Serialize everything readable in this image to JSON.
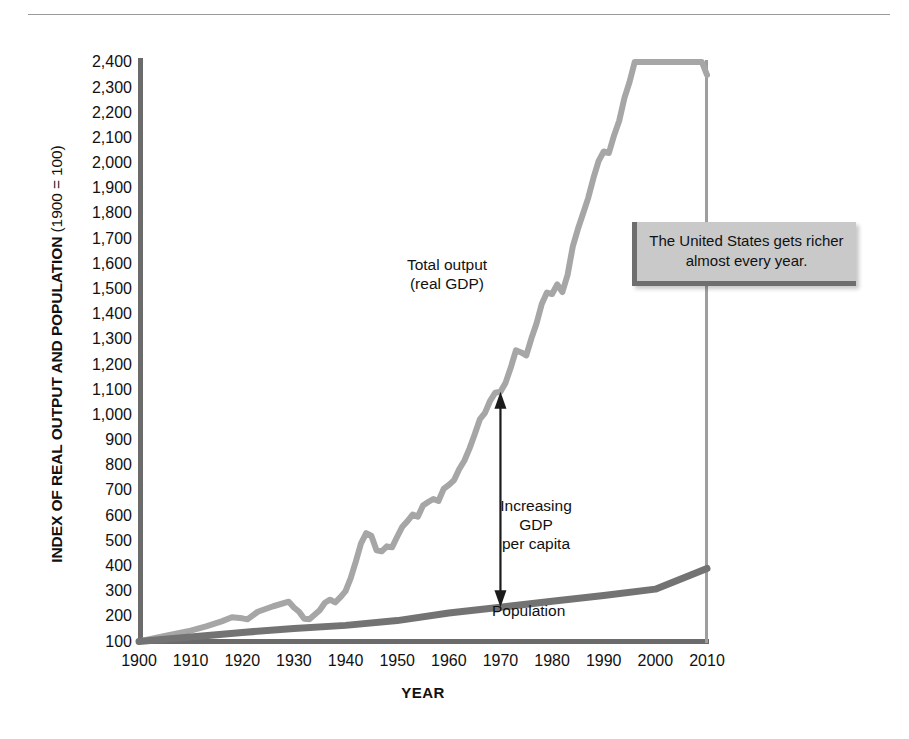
{
  "figure": {
    "y_axis_title_bold": "INDEX OF REAL OUTPUT AND POPULATION",
    "y_axis_title_light": " (1900 = 100)",
    "x_axis_title": "YEAR",
    "callout_text": "The United States gets richer almost every year.",
    "label_total_output": "Total output\n(real GDP)",
    "label_increasing_gdp": "Increasing\nGDP\nper capita",
    "label_population": "Population"
  },
  "colors": {
    "gdp_line": "#a6a6a6",
    "population_line": "#737373",
    "axis": "#6b6b6b",
    "callout_bg": "#c9c9c9",
    "callout_border": "#6e6e6e",
    "text": "#111111"
  },
  "chart_data": {
    "type": "line",
    "title": "",
    "xlabel": "YEAR",
    "ylabel": "INDEX OF REAL OUTPUT AND POPULATION (1900 = 100)",
    "xlim": [
      1900,
      2010
    ],
    "ylim": [
      100,
      2400
    ],
    "grid": false,
    "legend": "in-plot labels",
    "x_ticks": [
      1900,
      1910,
      1920,
      1930,
      1940,
      1950,
      1960,
      1970,
      1980,
      1990,
      2000,
      2010
    ],
    "y_ticks": [
      100,
      200,
      300,
      400,
      500,
      600,
      700,
      800,
      900,
      1000,
      1100,
      1200,
      1300,
      1400,
      1500,
      1600,
      1700,
      1800,
      1900,
      2000,
      2100,
      2200,
      2300,
      2400
    ],
    "y_tick_labels": [
      "100",
      "200",
      "300",
      "400",
      "500",
      "600",
      "700",
      "800",
      "900",
      "1,000",
      "1,100",
      "1,200",
      "1,300",
      "1,400",
      "1,500",
      "1,600",
      "1,700",
      "1,800",
      "1,900",
      "2,000",
      "2,100",
      "2,200",
      "2,300",
      "2,400"
    ],
    "annotations": [
      {
        "name": "callout",
        "text": "The United States gets richer almost every year."
      },
      {
        "name": "gdp-series-label",
        "text": "Total output (real GDP)"
      },
      {
        "name": "population-series-label",
        "text": "Population"
      },
      {
        "name": "gdp-per-capita-arrow",
        "text": "Increasing GDP per capita",
        "x": 1970,
        "y_from": 225,
        "y_to": 830
      }
    ],
    "series": [
      {
        "name": "Total output (real GDP)",
        "color": "#a6a6a6",
        "x": [
          1900,
          1905,
          1910,
          1913,
          1916,
          1918,
          1920,
          1921,
          1923,
          1926,
          1929,
          1930,
          1931,
          1932,
          1933,
          1934,
          1935,
          1936,
          1937,
          1938,
          1939,
          1940,
          1941,
          1942,
          1943,
          1944,
          1945,
          1946,
          1947,
          1948,
          1949,
          1950,
          1951,
          1952,
          1953,
          1954,
          1955,
          1956,
          1957,
          1958,
          1959,
          1960,
          1961,
          1962,
          1963,
          1964,
          1965,
          1966,
          1967,
          1968,
          1969,
          1970,
          1971,
          1972,
          1973,
          1974,
          1975,
          1976,
          1977,
          1978,
          1979,
          1980,
          1981,
          1982,
          1983,
          1984,
          1985,
          1986,
          1987,
          1988,
          1989,
          1990,
          1991,
          1992,
          1993,
          1994,
          1995,
          1996,
          1997,
          1998,
          1999,
          2000,
          2001,
          2002,
          2003,
          2004,
          2005,
          2006,
          2007,
          2008,
          2009,
          2010
        ],
        "y": [
          100,
          122,
          143,
          160,
          180,
          196,
          192,
          188,
          218,
          240,
          258,
          235,
          218,
          190,
          188,
          206,
          224,
          254,
          266,
          255,
          276,
          300,
          352,
          418,
          490,
          530,
          520,
          462,
          458,
          478,
          474,
          516,
          556,
          578,
          604,
          596,
          640,
          654,
          666,
          658,
          706,
          722,
          740,
          784,
          818,
          866,
          922,
          982,
          1008,
          1056,
          1088,
          1092,
          1128,
          1188,
          1256,
          1248,
          1236,
          1304,
          1364,
          1440,
          1486,
          1480,
          1518,
          1488,
          1556,
          1668,
          1738,
          1800,
          1862,
          1940,
          2008,
          2046,
          2040,
          2110,
          2168,
          2258,
          2322,
          2426,
          2540,
          2650,
          2760,
          2800,
          2812,
          2850,
          2920,
          3030,
          3120,
          3200,
          3260,
          3230,
          3140,
          2350
        ],
        "y_display_note": "index values clipped to plotted curve; right end reaches about 2,350 at 2010"
      },
      {
        "name": "Population",
        "color": "#737373",
        "x": [
          1900,
          1910,
          1920,
          1930,
          1940,
          1950,
          1960,
          1970,
          1980,
          1990,
          2000,
          2010
        ],
        "y": [
          100,
          118,
          136,
          152,
          164,
          183,
          213,
          236,
          260,
          283,
          308,
          390
        ]
      }
    ]
  }
}
